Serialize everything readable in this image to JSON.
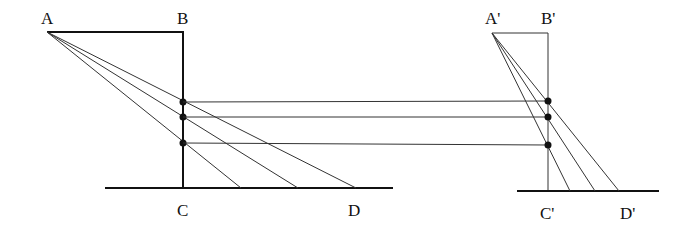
{
  "diagram": {
    "left_figure": {
      "labels": {
        "A": "A",
        "B": "B",
        "C": "C",
        "D": "D"
      },
      "points": {
        "A": [
          47,
          32
        ],
        "B": [
          183,
          32
        ],
        "C": [
          183,
          188
        ]
      },
      "baseline": [
        [
          105,
          188
        ],
        [
          393,
          188
        ]
      ],
      "ray_ends": [
        [
          241,
          188
        ],
        [
          298,
          188
        ],
        [
          356,
          188
        ]
      ],
      "dots": [
        [
          183,
          102
        ],
        [
          183,
          117
        ],
        [
          183,
          143
        ]
      ]
    },
    "right_figure": {
      "labels": {
        "A": "A'",
        "B": "B'",
        "C": "C'",
        "D": "D'"
      },
      "points": {
        "A": [
          492,
          33
        ],
        "B": [
          548,
          33
        ],
        "C": [
          548,
          191
        ]
      },
      "baseline": [
        [
          517,
          191
        ],
        [
          659,
          191
        ]
      ],
      "ray_ends": [
        [
          570,
          191
        ],
        [
          595,
          191
        ],
        [
          619,
          191
        ]
      ],
      "dots": [
        [
          548,
          101
        ],
        [
          548,
          117
        ],
        [
          548,
          145
        ]
      ]
    },
    "connectors": [
      [
        [
          183,
          102
        ],
        [
          548,
          101
        ]
      ],
      [
        [
          183,
          117
        ],
        [
          548,
          117
        ]
      ],
      [
        [
          183,
          143
        ],
        [
          548,
          145
        ]
      ]
    ]
  }
}
